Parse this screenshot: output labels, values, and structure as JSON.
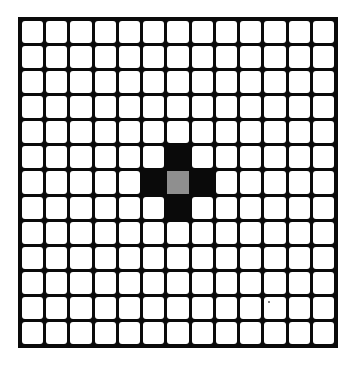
{
  "grid": {
    "rows": 13,
    "cols": 13,
    "colors": {
      "empty": "#ffffff",
      "filled": "#0a0a0a",
      "center": "#8f8f8f",
      "line": "#0a0a0a"
    },
    "cells": [
      {
        "row": 5,
        "col": 6,
        "state": "black"
      },
      {
        "row": 6,
        "col": 5,
        "state": "black"
      },
      {
        "row": 6,
        "col": 6,
        "state": "gray"
      },
      {
        "row": 6,
        "col": 7,
        "state": "black"
      },
      {
        "row": 7,
        "col": 6,
        "state": "black"
      }
    ]
  }
}
